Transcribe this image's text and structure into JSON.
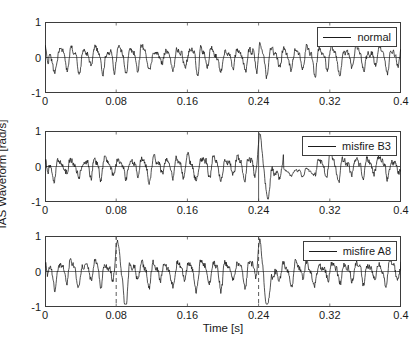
{
  "figure": {
    "xlabel": "Time [s]",
    "ylabel": "IAS Waveform [rad/s]"
  },
  "chart_data": {
    "type": "line",
    "title": "",
    "xlabel": "Time [s]",
    "ylabel": "IAS Waveform [rad/s]",
    "xlim": [
      0,
      0.4
    ],
    "ylim": [
      -1,
      1
    ],
    "xticks": [
      0,
      0.08,
      0.16,
      0.24,
      0.32,
      0.4
    ],
    "xticklabels": [
      "0",
      "0.08",
      "0.16",
      "0.24",
      "0.32",
      "0.4"
    ],
    "yticks": [
      -1,
      0,
      1
    ],
    "yticklabels": [
      "-1",
      "0",
      "1"
    ],
    "grid": false,
    "legend_position": "upper right",
    "line_color": "#1a1a1a",
    "panels": [
      {
        "index": 0,
        "legend": "normal",
        "markers": [],
        "description": "Quasi-periodic IAS oscillation, amplitude mostly within -0.5 to 0.6 rad/s, dense noise superimposed, large negative transient near t=0.",
        "seed": 101,
        "base_amp": 0.3,
        "fundamental_hz": 75,
        "noise_amp": 0.12,
        "samples": 900
      },
      {
        "index": 1,
        "legend": "misfire B3",
        "markers": [
          {
            "x": 0.24,
            "style": "solid"
          }
        ],
        "description": "IAS waveform with misfire event at t=0.24 s, peaks reaching 0.8 rad/s near t=0.08 and a suppressed low-amplitude region around t=0.28-0.30.",
        "seed": 202,
        "base_amp": 0.28,
        "fundamental_hz": 75,
        "noise_amp": 0.13,
        "samples": 900
      },
      {
        "index": 2,
        "legend": "misfire A8",
        "markers": [
          {
            "x": 0.08,
            "style": "dashed"
          },
          {
            "x": 0.24,
            "style": "dashed"
          }
        ],
        "description": "IAS waveform with misfire events marked at t=0.08 s and t=0.24 s, sharp positive spikes to ~0.8 rad/s at each marker followed by deep negative excursions to -0.8 rad/s.",
        "seed": 303,
        "base_amp": 0.3,
        "fundamental_hz": 75,
        "noise_amp": 0.13,
        "samples": 900
      }
    ]
  },
  "panel_geometry": [
    {
      "top": 22,
      "height": 71
    },
    {
      "top": 131,
      "height": 71
    },
    {
      "top": 236,
      "height": 71
    }
  ]
}
